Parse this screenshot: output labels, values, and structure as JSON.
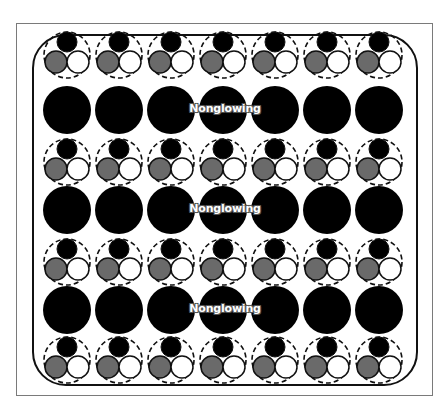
{
  "diagram": {
    "columns": 7,
    "column_x": [
      67,
      119,
      171,
      223,
      275,
      327,
      379
    ],
    "trio_rows_y": [
      55,
      162,
      262,
      360
    ],
    "large_rows_y": [
      110,
      210,
      310
    ],
    "large_circle_radius": 24,
    "trio": {
      "dashed_radius": 23,
      "top_circle": {
        "dx": 0,
        "dy": -13,
        "r": 10,
        "fill": "#000000"
      },
      "left_circle": {
        "dx": -11,
        "dy": 7,
        "r": 11,
        "fill": "#6a6a6a"
      },
      "right_circle": {
        "dx": 11,
        "dy": 7,
        "r": 11,
        "fill": "#ffffff"
      }
    },
    "labels": [
      {
        "text": "Nonglowing",
        "x": 225,
        "y": 108
      },
      {
        "text": "Nonglowing",
        "x": 225,
        "y": 208
      },
      {
        "text": "Nonglowing",
        "x": 225,
        "y": 308
      }
    ],
    "colors": {
      "large_fill": "#000000",
      "gray_fill": "#6a6a6a",
      "white_fill": "#ffffff",
      "stroke": "#111111",
      "outer_frame": "#7a7a7a"
    }
  }
}
